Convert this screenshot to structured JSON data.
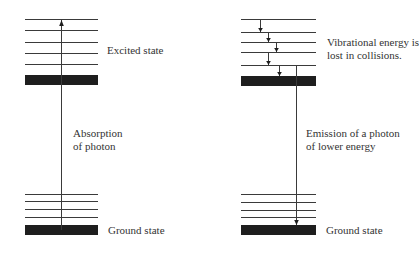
{
  "colors": {
    "line": "#3a3a3a",
    "bar": "#1e1e1e",
    "text": "#333333"
  },
  "left_panel": {
    "title": "Absorption",
    "excited_state": {
      "label": "Excited state",
      "x1": 25,
      "x2": 98,
      "lines_y": [
        19,
        30,
        42,
        53,
        64
      ],
      "bar": {
        "y": 75,
        "h": 10
      }
    },
    "ground_state": {
      "label": "Ground state",
      "x1": 25,
      "x2": 98,
      "lines_y": [
        194,
        201,
        209,
        217
      ],
      "bar": {
        "y": 225,
        "h": 10
      }
    },
    "transition": {
      "label_line1": "Absorption",
      "label_line2": "of photon",
      "x": 61,
      "y_from": 230,
      "y_to": 20,
      "direction": "up"
    }
  },
  "right_panel": {
    "title": "Emission",
    "excited_state": {
      "label_line1": "Vibrational energy is",
      "label_line2": "lost in collisions.",
      "x1": 241,
      "x2": 316,
      "lines_y": [
        19,
        32,
        42,
        52,
        65
      ],
      "bar": {
        "y": 76,
        "h": 10
      }
    },
    "ground_state": {
      "label": "Ground state",
      "x1": 241,
      "x2": 316,
      "lines_y": [
        194,
        202,
        210,
        217
      ],
      "bar": {
        "y": 225,
        "h": 10
      }
    },
    "relaxation_arrows": [
      {
        "x": 260,
        "y_from": 19,
        "y_to": 32
      },
      {
        "x": 268,
        "y_from": 32,
        "y_to": 42
      },
      {
        "x": 276,
        "y_from": 42,
        "y_to": 52
      },
      {
        "x": 268,
        "y_from": 52,
        "y_to": 65
      },
      {
        "x": 279,
        "y_from": 65,
        "y_to": 76
      }
    ],
    "transition": {
      "label_line1": "Emission of a photon",
      "label_line2": "of lower energy",
      "x": 296,
      "y_from": 65,
      "y_to": 225,
      "direction": "down"
    }
  }
}
